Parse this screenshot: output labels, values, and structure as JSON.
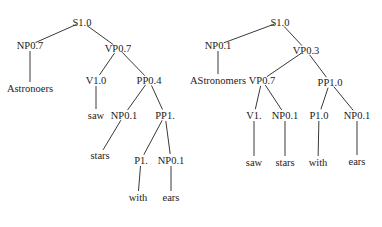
{
  "figure": {
    "colors": {
      "line": "#3a3a3a",
      "text": "#222222",
      "background": "#ffffff"
    },
    "trees": [
      {
        "name": "left-parse-tree",
        "nodes": [
          {
            "id": "S",
            "label": "S1.0",
            "x": 82,
            "y": 22
          },
          {
            "id": "NP",
            "label": "NP0.7",
            "x": 30,
            "y": 45
          },
          {
            "id": "VP",
            "label": "VP0.7",
            "x": 118,
            "y": 48
          },
          {
            "id": "w1",
            "label": "Astronoers",
            "x": 30,
            "y": 88
          },
          {
            "id": "V",
            "label": "V1.0",
            "x": 96,
            "y": 80
          },
          {
            "id": "PP",
            "label": "PP0.4",
            "x": 149,
            "y": 80
          },
          {
            "id": "w2",
            "label": "saw",
            "x": 96,
            "y": 115
          },
          {
            "id": "NP2",
            "label": "NP0.1",
            "x": 124,
            "y": 115
          },
          {
            "id": "PP2",
            "label": "PP1.",
            "x": 165,
            "y": 115
          },
          {
            "id": "w3",
            "label": "stars",
            "x": 100,
            "y": 155
          },
          {
            "id": "P",
            "label": "P1.",
            "x": 141,
            "y": 160
          },
          {
            "id": "NP3",
            "label": "NP0.1",
            "x": 171,
            "y": 160
          },
          {
            "id": "w4",
            "label": "with",
            "x": 138,
            "y": 197
          },
          {
            "id": "w5",
            "label": "ears",
            "x": 171,
            "y": 197
          }
        ],
        "edges": [
          [
            "S",
            "NP"
          ],
          [
            "S",
            "VP"
          ],
          [
            "NP",
            "w1"
          ],
          [
            "VP",
            "V"
          ],
          [
            "VP",
            "PP"
          ],
          [
            "V",
            "w2"
          ],
          [
            "PP",
            "NP2"
          ],
          [
            "PP",
            "PP2"
          ],
          [
            "NP2",
            "w3"
          ],
          [
            "PP2",
            "P"
          ],
          [
            "PP2",
            "NP3"
          ],
          [
            "P",
            "w4"
          ],
          [
            "NP3",
            "w5"
          ]
        ]
      },
      {
        "name": "right-parse-tree",
        "nodes": [
          {
            "id": "S",
            "label": "S1.0",
            "x": 280,
            "y": 22
          },
          {
            "id": "NP",
            "label": "NP0.1",
            "x": 218,
            "y": 45
          },
          {
            "id": "VP",
            "label": "VP0.3",
            "x": 306,
            "y": 50
          },
          {
            "id": "w1",
            "label": "AStronomers",
            "x": 218,
            "y": 80
          },
          {
            "id": "VP2",
            "label": "VP0.7",
            "x": 262,
            "y": 80
          },
          {
            "id": "PP",
            "label": "PP1.0",
            "x": 330,
            "y": 82
          },
          {
            "id": "V",
            "label": "V1.",
            "x": 254,
            "y": 115
          },
          {
            "id": "NP2",
            "label": "NP0.1",
            "x": 285,
            "y": 115
          },
          {
            "id": "P",
            "label": "P1.0",
            "x": 319,
            "y": 115
          },
          {
            "id": "NP3",
            "label": "NP0.1",
            "x": 357,
            "y": 115
          },
          {
            "id": "w2",
            "label": "saw",
            "x": 254,
            "y": 162
          },
          {
            "id": "w3",
            "label": "stars",
            "x": 285,
            "y": 162
          },
          {
            "id": "w4",
            "label": "with",
            "x": 318,
            "y": 162
          },
          {
            "id": "w5",
            "label": "ears",
            "x": 357,
            "y": 161
          }
        ],
        "edges": [
          [
            "S",
            "NP"
          ],
          [
            "S",
            "VP"
          ],
          [
            "NP",
            "w1"
          ],
          [
            "VP",
            "VP2"
          ],
          [
            "VP",
            "PP"
          ],
          [
            "VP2",
            "V"
          ],
          [
            "VP2",
            "NP2"
          ],
          [
            "PP",
            "P"
          ],
          [
            "PP",
            "NP3"
          ],
          [
            "V",
            "w2"
          ],
          [
            "NP2",
            "w3"
          ],
          [
            "P",
            "w4"
          ],
          [
            "NP3",
            "w5"
          ]
        ]
      }
    ]
  }
}
